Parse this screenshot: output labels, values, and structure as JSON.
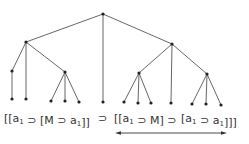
{
  "diagram": {
    "type": "parse-tree",
    "colors": {
      "edge": "#555555",
      "node": "#222222",
      "text": "#333333"
    },
    "nodes": [
      {
        "id": "root",
        "x": 103,
        "y": 14
      },
      {
        "id": "L",
        "x": 26,
        "y": 42
      },
      {
        "id": "R",
        "x": 172,
        "y": 44
      },
      {
        "id": "L1",
        "x": 12,
        "y": 71
      },
      {
        "id": "L3",
        "x": 65,
        "y": 72
      },
      {
        "id": "R1",
        "x": 139,
        "y": 73
      },
      {
        "id": "R3",
        "x": 207,
        "y": 74
      },
      {
        "id": "leaf1",
        "x": 12,
        "y": 99
      },
      {
        "id": "leaf2",
        "x": 26,
        "y": 99
      },
      {
        "id": "leaf3",
        "x": 51,
        "y": 101
      },
      {
        "id": "leaf4",
        "x": 65,
        "y": 101
      },
      {
        "id": "leaf5",
        "x": 79,
        "y": 102
      },
      {
        "id": "leaf6",
        "x": 103,
        "y": 102
      },
      {
        "id": "leaf7",
        "x": 124,
        "y": 102
      },
      {
        "id": "leaf8",
        "x": 138,
        "y": 103
      },
      {
        "id": "leaf9",
        "x": 151,
        "y": 103
      },
      {
        "id": "leaf10",
        "x": 171,
        "y": 103
      },
      {
        "id": "leaf11",
        "x": 192,
        "y": 104
      },
      {
        "id": "leaf12",
        "x": 206,
        "y": 104
      },
      {
        "id": "leaf13",
        "x": 221,
        "y": 105
      }
    ],
    "edges": [
      [
        "root",
        "L"
      ],
      [
        "root",
        "leaf6"
      ],
      [
        "root",
        "R"
      ],
      [
        "L",
        "L1"
      ],
      [
        "L",
        "leaf2"
      ],
      [
        "L",
        "L3"
      ],
      [
        "L1",
        "leaf1"
      ],
      [
        "L3",
        "leaf3"
      ],
      [
        "L3",
        "leaf4"
      ],
      [
        "L3",
        "leaf5"
      ],
      [
        "R",
        "R1"
      ],
      [
        "R",
        "leaf10"
      ],
      [
        "R",
        "R3"
      ],
      [
        "R1",
        "leaf7"
      ],
      [
        "R1",
        "leaf8"
      ],
      [
        "R1",
        "leaf9"
      ],
      [
        "R3",
        "leaf11"
      ],
      [
        "R3",
        "leaf12"
      ],
      [
        "R3",
        "leaf13"
      ]
    ],
    "formula": {
      "segments": [
        {
          "id": "left-antecedent",
          "x": 4,
          "parts": [
            "[[a",
            "1",
            " ⊃ [M ⊃ a",
            "1",
            "]]"
          ]
        },
        {
          "id": "main-connective",
          "x": 98,
          "parts": [
            "⊃"
          ]
        },
        {
          "id": "right-antecedent",
          "x": 114,
          "parts": [
            "[[a",
            "1",
            " ⊃ M] ⊃"
          ]
        },
        {
          "id": "right-consequent",
          "x": 181,
          "parts": [
            "[a",
            "1",
            " ⊃  a",
            "1",
            "]]]"
          ]
        }
      ],
      "baseline_y": 122
    },
    "arrow": {
      "x1": 115,
      "x2": 227,
      "y": 133,
      "double_headed": true
    }
  }
}
